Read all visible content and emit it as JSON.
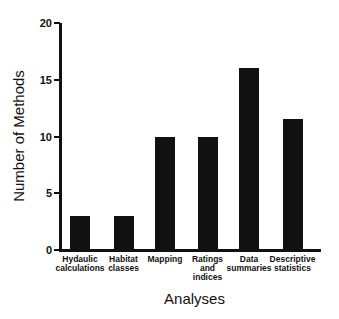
{
  "chart_data": {
    "type": "bar",
    "title": "",
    "xlabel": "Analyses",
    "ylabel": "Number of Methods",
    "ylim": [
      0,
      20
    ],
    "yticks": [
      0,
      5,
      10,
      15,
      20
    ],
    "grid": false,
    "legend": null,
    "categories": [
      "Hydaulic calculations",
      "Habitat classes",
      "Mapping",
      "Ratings and indices",
      "Data summaries",
      "Descriptive statistics"
    ],
    "category_display": [
      "Hydaulic\ncalculations",
      "Habitat\nclasses",
      "Mapping",
      "Ratings\nand\nindices",
      "Data\nsummaries",
      "Descriptive\nstatistics"
    ],
    "values": [
      3,
      3,
      10,
      10,
      16,
      11.5
    ],
    "bar_color": "#111111"
  }
}
